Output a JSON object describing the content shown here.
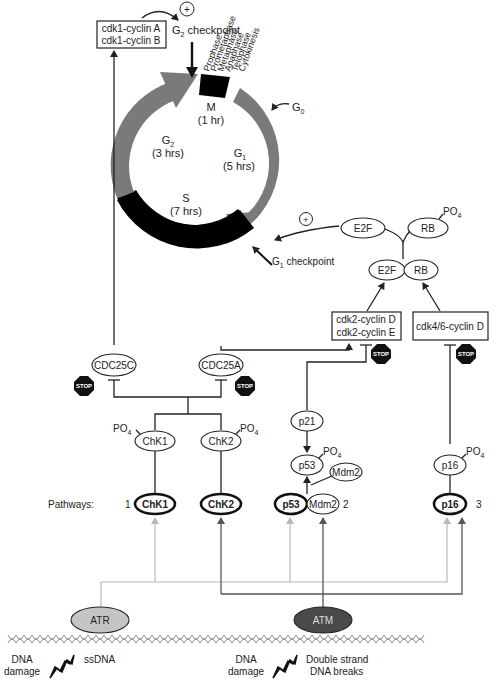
{
  "cell_cycle": {
    "phases": [
      {
        "name": "M",
        "duration": "(1 hr)",
        "color": "#000000"
      },
      {
        "name": "G1",
        "sub": "1",
        "duration": "(5 hrs)",
        "color": "#7a7a7a"
      },
      {
        "name": "S",
        "duration": "(7 hrs)",
        "color": "#000000"
      },
      {
        "name": "G2",
        "sub": "2",
        "duration": "(3 hrs)",
        "color": "#7a7a7a"
      }
    ],
    "m_subphases": [
      "Prophase",
      "Prometaphase",
      "Metaphase",
      "Anaphase",
      "Telophase",
      "Cytokinesis"
    ],
    "g0_label": "G",
    "g0_sub": "0",
    "g2_checkpoint": {
      "prefix": "G",
      "sub": "2",
      "suffix": " checkpoint"
    },
    "g1_checkpoint": {
      "prefix": "G",
      "sub": "1",
      "suffix": " checkpoint"
    },
    "plus_symbol": "+"
  },
  "boxes": {
    "cdk1": [
      "cdk1-cyclin A",
      "cdk1-cyclin B"
    ],
    "cdk2": [
      "cdk2-cyclin D",
      "cdk2-cyclin E"
    ],
    "cdk46": "cdk4/6-cyclin D"
  },
  "nodes": {
    "e2f_free": "E2F",
    "rb_phos": "RB",
    "e2f_bound": "E2F",
    "rb_bound": "RB",
    "cdc25c": "CDC25C",
    "cdc25a": "CDC25A",
    "chk1": "ChK1",
    "chk2": "ChK2",
    "p21": "p21",
    "p53": "p53",
    "mdm2_free": "Mdm2",
    "p16": "p16",
    "atr": "ATR",
    "atm": "ATM"
  },
  "phospho_label": {
    "base": "PO",
    "sub": "4"
  },
  "stop_label": "STOP",
  "pathways": {
    "label": "Pathways:",
    "items": [
      {
        "num": "1",
        "nodes": [
          "ChK1"
        ]
      },
      {
        "num": "",
        "nodes": [
          "ChK2"
        ]
      },
      {
        "num": "2",
        "nodes": [
          "p53",
          "Mdm2"
        ]
      },
      {
        "num": "3",
        "nodes": [
          "p16"
        ]
      }
    ]
  },
  "damage": {
    "left": {
      "label_line1": "DNA",
      "label_line2": "damage",
      "type": "ssDNA"
    },
    "right": {
      "label_line1": "DNA",
      "label_line2": "damage",
      "type_line1": "Double strand",
      "type_line2": "DNA breaks"
    }
  },
  "colors": {
    "atr_fill": "#c4c4c4",
    "atm_fill": "#4a4a4a",
    "atr_line": "#b8b8b8",
    "atm_line": "#555555",
    "cycle_gray": "#7a7a7a",
    "cycle_black": "#000000"
  }
}
